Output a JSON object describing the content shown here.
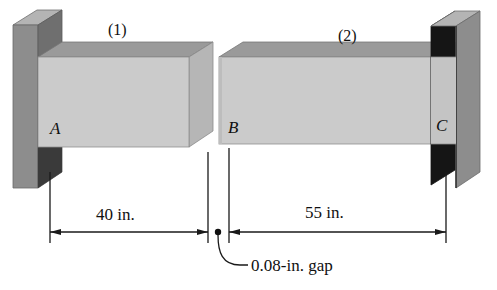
{
  "figure": {
    "members": [
      {
        "id": "member-1",
        "label": "(1)",
        "x": 122,
        "y": 26
      },
      {
        "id": "member-2",
        "label": "(2)",
        "x": 352,
        "y": 32
      }
    ],
    "joints": [
      {
        "id": "joint-a",
        "label": "A",
        "x": 58,
        "y": 129
      },
      {
        "id": "joint-b",
        "label": "B",
        "x": 233,
        "y": 128
      },
      {
        "id": "joint-c",
        "label": "C",
        "x": 442,
        "y": 126
      }
    ],
    "dimensions": [
      {
        "id": "dimension-left",
        "label": "40 in.",
        "x": 118,
        "y": 219,
        "value": 40,
        "units": "in."
      },
      {
        "id": "dimension-right",
        "label": "55 in.",
        "x": 332,
        "y": 217,
        "value": 55,
        "units": "in."
      }
    ],
    "annotations": [
      {
        "id": "gap-callout",
        "label": "0.08-in. gap",
        "x": 253,
        "y": 269,
        "value": 0.08,
        "units": "in."
      }
    ],
    "colors": {
      "wall_front": "#8e8e8e",
      "wall_side": "#a8a8a8",
      "wall_dark": "#1a1a1a",
      "bar_front": "#cbcbcb",
      "bar_top": "#9a9a9a",
      "bar_end": "#b4b4b4",
      "line": "#1a1a1a",
      "background": "#ffffff"
    }
  }
}
